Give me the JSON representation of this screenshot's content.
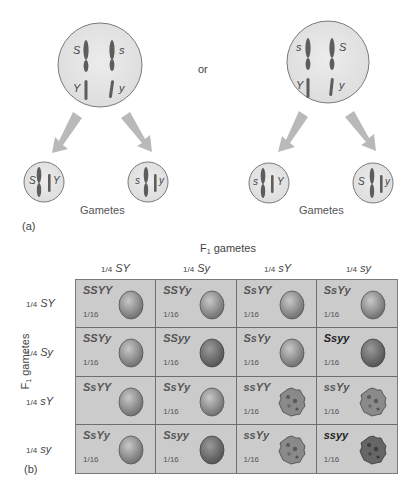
{
  "part_a": {
    "panel_label": "(a)",
    "connector": "or",
    "parents": [
      {
        "chromosomes": [
          {
            "top": "S",
            "bottom": "Y"
          },
          {
            "top": "s",
            "bottom": "y"
          }
        ]
      },
      {
        "chromosomes": [
          {
            "top": "s",
            "bottom": "Y"
          },
          {
            "top": "S",
            "bottom": "y"
          }
        ]
      }
    ],
    "gametes_label_left": "Gametes",
    "gametes_label_right": "Gametes",
    "gametes": [
      {
        "alleles": [
          "S",
          "Y"
        ]
      },
      {
        "alleles": [
          "s",
          "y"
        ]
      },
      {
        "alleles": [
          "s",
          "Y"
        ]
      },
      {
        "alleles": [
          "S",
          "y"
        ]
      }
    ]
  },
  "part_b": {
    "panel_label": "(b)",
    "top_axis_label": "F",
    "top_axis_sub": "1",
    "top_axis_suffix": " gametes",
    "side_axis_label": "F",
    "side_axis_sub": "1",
    "side_axis_suffix": " gametes",
    "fraction": "1/4",
    "columns": [
      "SY",
      "Sy",
      "sY",
      "sy"
    ],
    "rows": [
      "SY",
      "Sy",
      "sY",
      "sy"
    ],
    "cells": [
      [
        {
          "genotype": "SSYY",
          "prob": "1/16",
          "pea": "smooth-yellow"
        },
        {
          "genotype": "SSYy",
          "prob": "1/16",
          "pea": "smooth-yellow"
        },
        {
          "genotype": "SsYY",
          "prob": "1/16",
          "pea": "smooth-yellow"
        },
        {
          "genotype": "SsYy",
          "prob": "1/16",
          "pea": "smooth-yellow"
        }
      ],
      [
        {
          "genotype": "SSYy",
          "prob": "1/16",
          "pea": "smooth-yellow"
        },
        {
          "genotype": "SSyy",
          "prob": "1/16",
          "pea": "smooth-green"
        },
        {
          "genotype": "SsYy",
          "prob": "1/16",
          "pea": "smooth-yellow"
        },
        {
          "genotype": "Ssyy",
          "prob": "1/16",
          "pea": "smooth-green",
          "bold": true
        }
      ],
      [
        {
          "genotype": "SsYY",
          "prob": "",
          "pea": "smooth-yellow"
        },
        {
          "genotype": "SsYy",
          "prob": "1/16",
          "pea": "smooth-yellow"
        },
        {
          "genotype": "ssYY",
          "prob": "1/16",
          "pea": "wrinkled-yellow"
        },
        {
          "genotype": "ssYy",
          "prob": "1/16",
          "pea": "wrinkled-yellow"
        }
      ],
      [
        {
          "genotype": "SsYy",
          "prob": "1/16",
          "pea": "smooth-yellow"
        },
        {
          "genotype": "Ssyy",
          "prob": "1/16",
          "pea": "smooth-green"
        },
        {
          "genotype": "ssYy",
          "prob": "1/16",
          "pea": "wrinkled-yellow"
        },
        {
          "genotype": "ssyy",
          "prob": "1/16",
          "pea": "wrinkled-green",
          "bold": true
        }
      ]
    ]
  },
  "colors": {
    "cell_bg": "#cbcbcb",
    "circle_fill": "#e6e6e6",
    "arrow": "#b9b9b9",
    "chromosome": "#5a5a5a"
  }
}
